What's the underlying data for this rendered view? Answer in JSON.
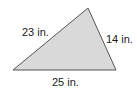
{
  "figure": {
    "type": "triangle",
    "fill_color": "#d9d9d9",
    "stroke_color": "#555555",
    "vertices": {
      "top": [
        88,
        8
      ],
      "bottom_left": [
        13,
        70
      ],
      "bottom_right": [
        116,
        70
      ]
    },
    "sides": [
      {
        "id": "left",
        "label": "23 in."
      },
      {
        "id": "right",
        "label": "14 in."
      },
      {
        "id": "bottom",
        "label": "25 in."
      }
    ]
  }
}
